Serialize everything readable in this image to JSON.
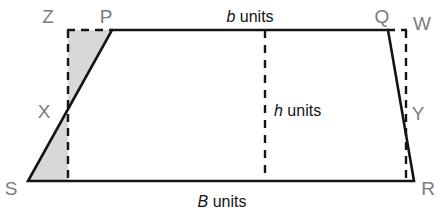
{
  "figure": {
    "colors": {
      "stroke": "#141414",
      "dashed_stroke": "#141414",
      "shade_fill": "#d8d8d8",
      "vertex_label": "#7c7c7c",
      "dimension_label": "#141414",
      "background": "#ffffff"
    },
    "vertices": [
      {
        "id": "vertex-z",
        "label": "Z",
        "x": 48,
        "y": 18,
        "point_x": 68,
        "point_y": 30
      },
      {
        "id": "vertex-p",
        "label": "P",
        "x": 106,
        "y": 18,
        "point_x": 112,
        "point_y": 30
      },
      {
        "id": "vertex-q",
        "label": "Q",
        "x": 382,
        "y": 18,
        "point_x": 388,
        "point_y": 30
      },
      {
        "id": "vertex-w",
        "label": "W",
        "x": 412,
        "y": 24,
        "point_x": 406,
        "point_y": 30
      },
      {
        "id": "vertex-x",
        "label": "X",
        "x": 44,
        "y": 113,
        "point_x": 68,
        "point_y": 112
      },
      {
        "id": "vertex-y",
        "label": "Y",
        "x": 414,
        "y": 115,
        "point_x": 406,
        "point_y": 110
      },
      {
        "id": "vertex-s",
        "label": "S",
        "x": 6,
        "y": 190,
        "point_x": 28,
        "point_y": 181
      },
      {
        "id": "vertex-r",
        "label": "R",
        "x": 424,
        "y": 190,
        "point_x": 414,
        "point_y": 181
      }
    ],
    "dimensions": [
      {
        "id": "top-base",
        "symbol": "b",
        "unit": "units",
        "text": "b units",
        "x": 250,
        "y": 18,
        "describes": "top parallel side P to Q"
      },
      {
        "id": "height",
        "symbol": "h",
        "unit": "units",
        "text": "h units",
        "x": 272,
        "y": 112,
        "describes": "perpendicular height between the parallel sides"
      },
      {
        "id": "bottom-base",
        "symbol": "B",
        "unit": "units",
        "text": "B units",
        "x": 222,
        "y": 203,
        "describes": "bottom parallel side S to R"
      }
    ],
    "shapes": {
      "trapezoid": {
        "name": "trapezoid-PQRS",
        "points": "112,30 388,30 414,181 28,181"
      },
      "dashed_rectangle": {
        "name": "bounding-rectangle-ZWRS-guides",
        "left_vertical": {
          "x1": 68,
          "y1": 30,
          "x2": 68,
          "y2": 181
        },
        "top_left_segment": {
          "x1": 68,
          "y1": 30,
          "x2": 112,
          "y2": 30
        },
        "right_vertical": {
          "x1": 406,
          "y1": 30,
          "x2": 406,
          "y2": 181
        },
        "top_right_segment": {
          "x1": 388,
          "y1": 30,
          "x2": 406,
          "y2": 30
        }
      },
      "height_line": {
        "name": "height-dashed-line",
        "x1": 265,
        "y1": 30,
        "x2": 265,
        "y2": 181
      },
      "shaded_triangles": [
        {
          "name": "shaded-triangle-upper-ZPX",
          "points": "68,30 112,30 68,112"
        },
        {
          "name": "shaded-triangle-lower-SXfoot",
          "points": "28,181 68,112 68,181"
        }
      ]
    }
  }
}
